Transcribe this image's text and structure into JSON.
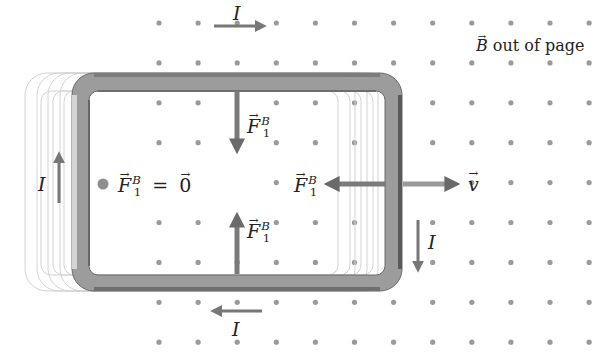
{
  "diagram": {
    "field_label": {
      "vector": "B",
      "text": "out of page"
    },
    "field_symbol": "dot (out of page)",
    "colors": {
      "background": "#ffffff",
      "field_dot": "#9a9a9a",
      "loop_band_dark": "#6e6e6e",
      "loop_band_light": "#c9c9c9",
      "ghost_loop": "#cfcfcf",
      "arrow": "#777777",
      "text": "#222222"
    },
    "current_labels": {
      "top": "I",
      "left": "I",
      "right": "I",
      "bottom": "I"
    },
    "force_labels": {
      "top": {
        "symbol": "F",
        "sub": "1",
        "sup": "B"
      },
      "bottom": {
        "symbol": "F",
        "sub": "1",
        "sup": "B"
      },
      "right": {
        "symbol": "F",
        "sub": "1",
        "sup": "B"
      },
      "left": {
        "symbol": "F",
        "sub": "1",
        "sup": "B",
        "equals": "=",
        "zero": "0"
      }
    },
    "velocity_label": "v"
  }
}
